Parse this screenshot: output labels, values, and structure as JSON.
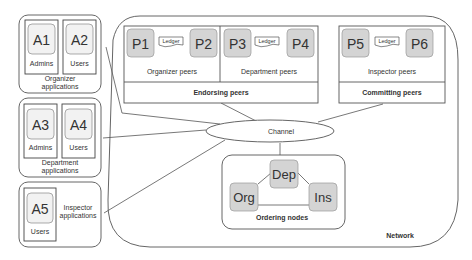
{
  "groups": {
    "organizer": {
      "label_line1": "Organizer",
      "label_line2": "applications",
      "apps": [
        {
          "id": "A1",
          "role": "Admins"
        },
        {
          "id": "A2",
          "role": "Users"
        }
      ]
    },
    "department": {
      "label_line1": "Department",
      "label_line2": "applications",
      "apps": [
        {
          "id": "A3",
          "role": "Admins"
        },
        {
          "id": "A4",
          "role": "Users"
        }
      ]
    },
    "inspector": {
      "label_line1": "Inspector",
      "label_line2": "applications",
      "apps": [
        {
          "id": "A5",
          "role": "Users"
        }
      ]
    }
  },
  "network": {
    "label": "Network",
    "endorsing": {
      "label": "Endorsing peers",
      "sections": [
        {
          "label": "Organizer peers",
          "peers": [
            "P1",
            "P2"
          ],
          "ledger": "Ledger"
        },
        {
          "label": "Department peers",
          "peers": [
            "P3",
            "P4"
          ],
          "ledger": "Ledger"
        }
      ]
    },
    "committing": {
      "label": "Committing peers",
      "sections": [
        {
          "label": "Inspector peers",
          "peers": [
            "P5",
            "P6"
          ],
          "ledger": "Ledger"
        }
      ]
    },
    "channel": {
      "label": "Channel"
    },
    "ordering": {
      "label": "Ordering nodes",
      "nodes": [
        "Org",
        "Dep",
        "Ins"
      ]
    }
  },
  "colors": {
    "node_fill": "#d4d4d4",
    "app_fill": "#f2f2f2",
    "stroke": "#555555"
  }
}
